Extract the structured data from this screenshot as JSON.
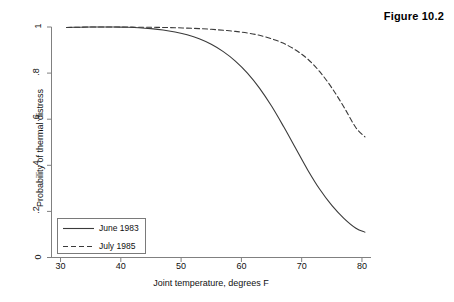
{
  "figure": {
    "caption": "Figure 10.2"
  },
  "chart_data": {
    "type": "line",
    "title": "Figure 10.2",
    "xlabel": "Joint temperature, degrees F",
    "ylabel": "Probability of thermal distress",
    "xlim": [
      28.5,
      81.5
    ],
    "ylim": [
      0,
      1
    ],
    "xticks": [
      30,
      40,
      50,
      60,
      70,
      80
    ],
    "xticklabels": [
      "30",
      "40",
      "50",
      "60",
      "70",
      "80"
    ],
    "yticks": [
      0,
      0.2,
      0.4,
      0.6,
      0.8,
      1
    ],
    "yticklabels": [
      "0",
      ".2",
      ".4",
      ".6",
      ".8",
      "1"
    ],
    "grid": false,
    "legend_position": "lower-left",
    "series": [
      {
        "name": "June 1983",
        "style": "solid",
        "color": "#3a3a3a",
        "x": [
          31,
          33,
          35,
          37,
          39,
          41,
          43,
          45,
          47,
          49,
          51,
          53,
          55,
          57,
          59,
          61,
          63,
          65,
          67,
          69,
          71,
          73,
          75,
          77,
          79,
          80.5
        ],
        "y": [
          0.998,
          0.999,
          1.0,
          1.0,
          1.0,
          0.999,
          0.997,
          0.993,
          0.987,
          0.978,
          0.966,
          0.949,
          0.925,
          0.893,
          0.852,
          0.8,
          0.735,
          0.657,
          0.568,
          0.474,
          0.38,
          0.296,
          0.226,
          0.17,
          0.127,
          0.11
        ]
      },
      {
        "name": "July 1985",
        "style": "dashed",
        "color": "#3a3a3a",
        "x": [
          31,
          33,
          35,
          37,
          39,
          41,
          43,
          45,
          47,
          49,
          51,
          53,
          55,
          57,
          59,
          61,
          63,
          65,
          67,
          69,
          71,
          73,
          75,
          77,
          79,
          80.5
        ],
        "y": [
          0.998,
          0.999,
          1.0,
          1.0,
          1.0,
          1.0,
          0.999,
          0.999,
          0.998,
          0.997,
          0.995,
          0.993,
          0.99,
          0.986,
          0.981,
          0.974,
          0.964,
          0.949,
          0.929,
          0.9,
          0.861,
          0.806,
          0.736,
          0.653,
          0.563,
          0.523
        ]
      }
    ]
  },
  "legend": {
    "entries": [
      {
        "label": "June 1983",
        "style": "solid"
      },
      {
        "label": "July 1985",
        "style": "dashed"
      }
    ]
  }
}
